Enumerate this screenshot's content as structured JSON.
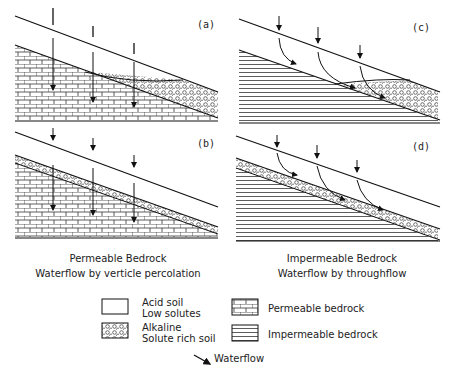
{
  "panels": {
    "a": {
      "label": "(a)"
    },
    "b": {
      "label": "(b)"
    },
    "c": {
      "label": "(c)"
    },
    "d": {
      "label": "(d)"
    }
  },
  "captions": {
    "left_line1": "Permeable Bedrock",
    "left_line2": "Waterflow by verticle percolation",
    "right_line1": "Impermeable Bedrock",
    "right_line2": "Waterflow by throughflow"
  },
  "legend": {
    "acid_line1": "Acid soil",
    "acid_line2": "Low solutes",
    "alkaline_line1": "Alkaline",
    "alkaline_line2": "Solute rich soil",
    "permeable": "Permeable bedrock",
    "impermeable": "Impermeable bedrock",
    "waterflow": "Waterflow"
  }
}
